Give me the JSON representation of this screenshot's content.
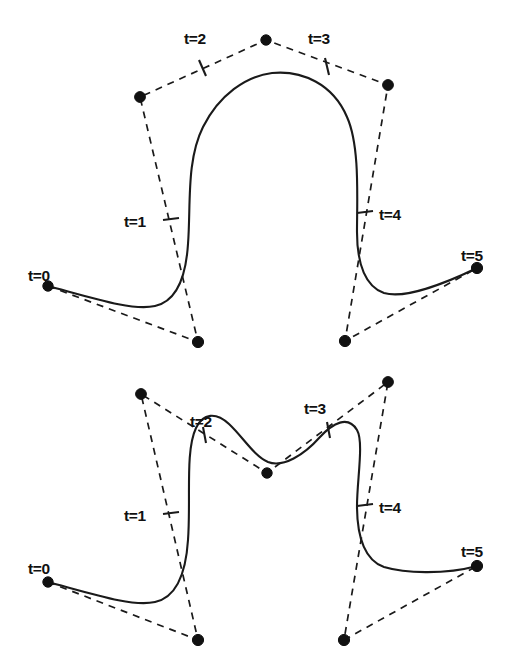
{
  "figure": {
    "background_color": "#ffffff",
    "stroke_color": "#1a1a1a",
    "curve_style": "solid",
    "hull_style": "dashed",
    "width": 516,
    "height": 670,
    "panels": [
      {
        "id": "top-panel",
        "name": "upper-spline-figure",
        "knot_labels": [
          {
            "text": "t=0",
            "x": 28,
            "y": 281,
            "anchor": "start"
          },
          {
            "text": "t=1",
            "x": 124,
            "y": 227,
            "anchor": "start"
          },
          {
            "text": "t=2",
            "x": 184,
            "y": 44,
            "anchor": "start"
          },
          {
            "text": "t=3",
            "x": 308,
            "y": 44,
            "anchor": "start"
          },
          {
            "text": "t=4",
            "x": 379,
            "y": 220,
            "anchor": "start"
          },
          {
            "text": "t=5",
            "x": 461,
            "y": 261,
            "anchor": "start"
          }
        ],
        "knot_ticks": [
          {
            "name": "tick-t1",
            "x1": 163,
            "y1": 220,
            "x2": 179,
            "y2": 218
          },
          {
            "name": "tick-t2",
            "x1": 199,
            "y1": 60,
            "x2": 206,
            "y2": 76
          },
          {
            "name": "tick-t3",
            "x1": 325,
            "y1": 58,
            "x2": 329,
            "y2": 75
          },
          {
            "name": "tick-t4",
            "x1": 357,
            "y1": 213,
            "x2": 373,
            "y2": 211
          }
        ],
        "control_points": [
          {
            "name": "cp-0",
            "x": 48,
            "y": 286,
            "r": 5.2
          },
          {
            "name": "cp-1",
            "x": 198,
            "y": 342,
            "r": 5.6
          },
          {
            "name": "cp-2",
            "x": 140,
            "y": 97,
            "r": 5.4
          },
          {
            "name": "cp-3",
            "x": 266,
            "y": 40,
            "r": 5.2
          },
          {
            "name": "cp-4",
            "x": 388,
            "y": 85,
            "r": 5.4
          },
          {
            "name": "cp-5",
            "x": 345,
            "y": 341,
            "r": 5.6
          },
          {
            "name": "cp-6",
            "x": 477,
            "y": 268,
            "r": 5.6
          }
        ],
        "control_polygon": [
          [
            48,
            286
          ],
          [
            198,
            342
          ],
          [
            140,
            97
          ],
          [
            266,
            40
          ],
          [
            388,
            85
          ],
          [
            345,
            341
          ],
          [
            477,
            268
          ]
        ],
        "curve_path": "M 48 286 C 96 299 133 311 155 306 C 178 301 186 275 188 244 C 191 206 186 161 203 127 C 219 95 246 76 272 73 C 302 70 333 84 347 117 C 360 146 357 198 357 232 C 357 265 366 287 384 293 C 404 299 444 284 477 268"
      },
      {
        "id": "bottom-panel",
        "name": "lower-spline-figure",
        "knot_labels": [
          {
            "text": "t=0",
            "x": 28,
            "y": 574,
            "anchor": "start"
          },
          {
            "text": "t=1",
            "x": 124,
            "y": 521,
            "anchor": "start"
          },
          {
            "text": "t=2",
            "x": 190,
            "y": 427,
            "anchor": "start"
          },
          {
            "text": "t=3",
            "x": 304,
            "y": 414,
            "anchor": "start"
          },
          {
            "text": "t=4",
            "x": 379,
            "y": 513,
            "anchor": "start"
          },
          {
            "text": "t=5",
            "x": 461,
            "y": 557,
            "anchor": "start"
          }
        ],
        "knot_ticks": [
          {
            "name": "tick-t1",
            "x1": 163,
            "y1": 514,
            "x2": 179,
            "y2": 512
          },
          {
            "name": "tick-t2",
            "x1": 203,
            "y1": 427,
            "x2": 206,
            "y2": 443
          },
          {
            "name": "tick-t3",
            "x1": 327,
            "y1": 422,
            "x2": 330,
            "y2": 438
          },
          {
            "name": "tick-t4",
            "x1": 357,
            "y1": 506,
            "x2": 373,
            "y2": 504
          }
        ],
        "control_points": [
          {
            "name": "cp-0",
            "x": 48,
            "y": 582,
            "r": 5.2
          },
          {
            "name": "cp-1",
            "x": 198,
            "y": 640,
            "r": 5.6
          },
          {
            "name": "cp-2",
            "x": 141,
            "y": 394,
            "r": 5.4
          },
          {
            "name": "cp-3",
            "x": 267,
            "y": 473,
            "r": 5.2
          },
          {
            "name": "cp-4",
            "x": 388,
            "y": 382,
            "r": 5.4
          },
          {
            "name": "cp-5",
            "x": 344,
            "y": 640,
            "r": 5.6
          },
          {
            "name": "cp-6",
            "x": 477,
            "y": 566,
            "r": 5.6
          }
        ],
        "control_polygon": [
          [
            48,
            582
          ],
          [
            198,
            640
          ],
          [
            141,
            394
          ],
          [
            267,
            473
          ],
          [
            388,
            382
          ],
          [
            344,
            640
          ],
          [
            477,
            566
          ]
        ],
        "curve_path": "M 48 582 C 96 595 133 607 155 602 C 178 597 186 571 188 540 C 191 500 185 451 196 428 C 203 413 216 412 229 424 C 243 437 254 456 268 462 C 283 468 304 455 320 437 C 333 423 348 415 357 430 C 364 442 357 480 357 506 C 357 539 366 561 384 567 C 404 573 444 575 477 566"
      }
    ]
  }
}
